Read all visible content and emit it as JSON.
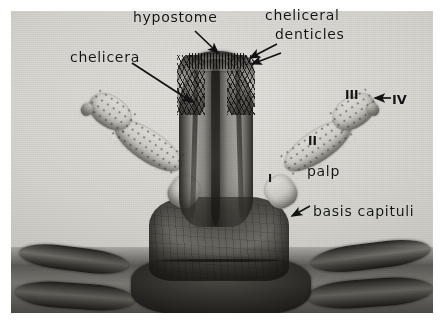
{
  "figure": {
    "type": "photomicrograph",
    "medium": "black-and-white halftone plate on white page",
    "plate_border_color": "#ffffff",
    "ink_color": "#121212"
  },
  "labels": {
    "hypostome": "hypostome",
    "cheliceral_line1": "cheliceral",
    "cheliceral_line2": "denticles",
    "chelicera": "chelicera",
    "palp": "palp",
    "basis_capituli": "basis capituli",
    "segment_four": "IV",
    "segment_three": "III",
    "segment_two": "II",
    "segment_one": "I"
  },
  "annotations": [
    {
      "name": "hypostome-arrow",
      "label": "hypostome",
      "points_to": "central hypostome tip"
    },
    {
      "name": "cheliceral-denticles-arrow-upper",
      "label": "cheliceral denticles",
      "points_to": "right cheliceral digit denticles"
    },
    {
      "name": "cheliceral-denticles-arrow-lower",
      "label": "cheliceral denticles",
      "points_to": "right cheliceral digit denticles"
    },
    {
      "name": "chelicera-arrow",
      "label": "chelicera",
      "points_to": "left cheliceral shaft"
    },
    {
      "name": "basis-capituli-arrow",
      "label": "basis capituli",
      "points_to": "basis capituli plate"
    },
    {
      "name": "segment-iv-arrow",
      "label": "IV",
      "points_to": "fourth palpal segment"
    }
  ],
  "structures": [
    "hypostome",
    "cheliceral denticles",
    "chelicera",
    "palp",
    "basis capituli",
    "palpal segment I",
    "palpal segment II",
    "palpal segment III",
    "palpal segment IV"
  ]
}
